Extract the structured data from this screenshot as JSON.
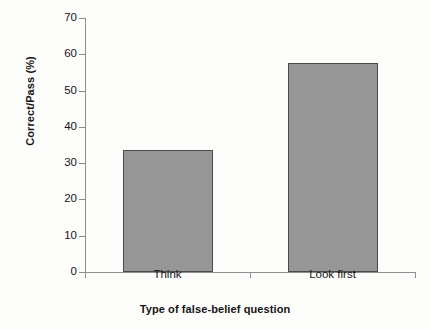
{
  "chart_data": {
    "type": "bar",
    "title": "",
    "subtitle": "",
    "categories": [
      "Think",
      "Look first"
    ],
    "values": [
      33.6,
      57.6
    ],
    "series": [
      {
        "name": "Correct/Pass (%)",
        "values": [
          33.6,
          57.6
        ]
      }
    ],
    "xlabel": "Type of false-belief question",
    "ylabel": "Correct/Pass (%)",
    "ylim": [
      0,
      70
    ],
    "yticks": [
      0,
      10,
      20,
      30,
      40,
      50,
      60,
      70
    ],
    "ytick_labels": [
      "0",
      "10",
      "20",
      "30",
      "40",
      "50",
      "60",
      "70"
    ],
    "grid": false,
    "legend": false,
    "legend_position": "none",
    "bar_color": "#969696",
    "bar_edge_color": "#4a4a4a",
    "axis_color": "#8e8e8e",
    "background_color": "#fdfdfc",
    "annotations": []
  }
}
